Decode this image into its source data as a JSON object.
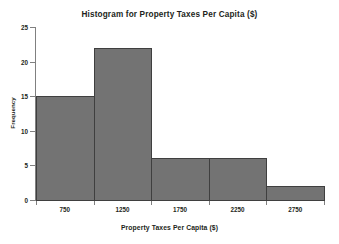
{
  "chart_data": {
    "type": "bar",
    "title": "Histogram for Property Taxes Per Capita ($)",
    "xlabel": "Property Taxes Per Capita ($)",
    "ylabel": "Frequency",
    "categories": [
      "750",
      "1250",
      "1750",
      "2250",
      "2750"
    ],
    "values": [
      15,
      22,
      6,
      6,
      2
    ],
    "bin_edges": [
      500,
      1000,
      1500,
      2000,
      2500,
      3000
    ],
    "bin_width": 500,
    "xlim": [
      500,
      3000
    ],
    "ylim": [
      0,
      25
    ],
    "yticks": [
      0,
      5,
      10,
      15,
      20,
      25
    ],
    "ytick_labels": [
      "0",
      "5",
      "10",
      "15",
      "20",
      "25"
    ],
    "xticks": [
      750,
      1250,
      1750,
      2250,
      2750
    ],
    "xtick_labels": [
      "750",
      "1250",
      "1750",
      "2250",
      "2750"
    ],
    "grid": false,
    "legend": "none",
    "bar_fill_color": "#737373",
    "bar_edge_color": "#3f3f3f",
    "axis_color": "#808080",
    "text_color": "#231f20",
    "background_color": "#ffffff"
  }
}
